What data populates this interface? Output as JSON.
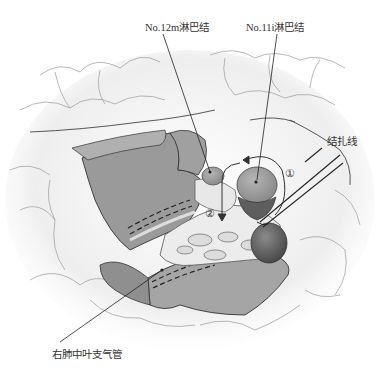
{
  "figure": {
    "type": "anatomical-illustration",
    "labels": {
      "node_12m": "No.12m淋巴结",
      "node_11i": "No.11i淋巴结",
      "ligature": "结扎线",
      "bronchus": "右肺中叶支气管"
    },
    "step_markers": [
      "①",
      "②"
    ],
    "colors": {
      "tissue_dark": "#8e8e8e",
      "tissue_mid": "#a9a9a9",
      "node_fill": "#9a9a9a",
      "node_dark": "#5a5a5a",
      "lung_light": "#f2f2f2",
      "outline": "#333333",
      "background": "#ffffff"
    }
  }
}
